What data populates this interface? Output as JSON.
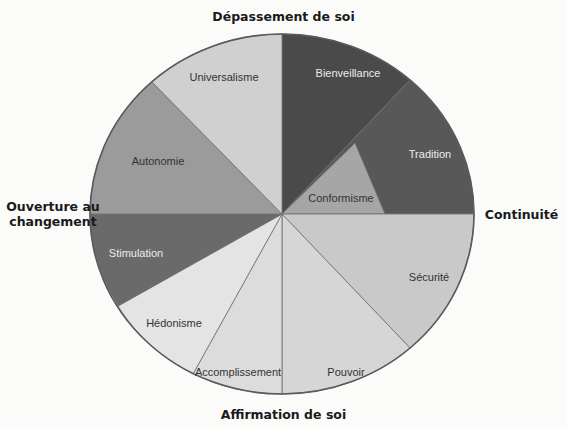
{
  "diagram": {
    "axes": {
      "top": "Dépassement de soi",
      "left_line1": "Ouverture au",
      "left_line2": "changement",
      "right": "Continuité",
      "bottom": "Affirmation de soi"
    },
    "slices": [
      {
        "id": "bienveillance",
        "label": "Bienveillance",
        "color": "#4a4a4a",
        "text": "dark"
      },
      {
        "id": "tradition",
        "label": "Tradition",
        "color": "#585858",
        "text": "dark"
      },
      {
        "id": "conformisme",
        "label": "Conformisme",
        "color": "#a6a6a6",
        "text": "light"
      },
      {
        "id": "securite",
        "label": "Sécurité",
        "color": "#c9c9c9",
        "text": "light"
      },
      {
        "id": "pouvoir",
        "label": "Pouvoir",
        "color": "#d6d6d6",
        "text": "light"
      },
      {
        "id": "accomplissement",
        "label": "Accomplissement",
        "color": "#dcdcdc",
        "text": "light"
      },
      {
        "id": "hedonisme",
        "label": "Hédonisme",
        "color": "#e4e4e4",
        "text": "light"
      },
      {
        "id": "stimulation",
        "label": "Stimulation",
        "color": "#6a6a6a",
        "text": "dark"
      },
      {
        "id": "autonomie",
        "label": "Autonomie",
        "color": "#9b9b9b",
        "text": "light"
      },
      {
        "id": "universalisme",
        "label": "Universalisme",
        "color": "#d0d0d0",
        "text": "light"
      }
    ]
  }
}
